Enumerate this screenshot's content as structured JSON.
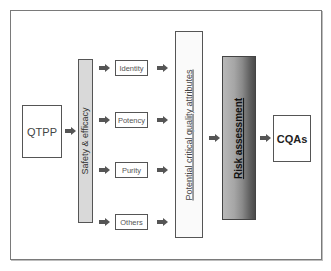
{
  "diagram": {
    "nodes": {
      "qtpp": "QTPP",
      "safety_efficacy": "Safety & efficacy",
      "attributes": [
        "Identity",
        "Potency",
        "Purity",
        "Others"
      ],
      "potential_cqa": "Potential critical quality attributes",
      "risk_assessment": "Risk assessment",
      "cqas": "CQAs"
    },
    "edges": [
      [
        "QTPP",
        "Safety & efficacy"
      ],
      [
        "Safety & efficacy",
        "Identity"
      ],
      [
        "Safety & efficacy",
        "Potency"
      ],
      [
        "Safety & efficacy",
        "Purity"
      ],
      [
        "Safety & efficacy",
        "Others"
      ],
      [
        "Identity",
        "Potential critical quality attributes"
      ],
      [
        "Potency",
        "Potential critical quality attributes"
      ],
      [
        "Purity",
        "Potential critical quality attributes"
      ],
      [
        "Others",
        "Potential critical quality attributes"
      ],
      [
        "Potential critical quality attributes",
        "Risk assessment"
      ],
      [
        "Risk assessment",
        "CQAs"
      ]
    ],
    "colors": {
      "arrow": "#555555",
      "border": "#555555",
      "safety_fill": "#d9d9d9",
      "risk_gradient_light": "#b8b8b8",
      "risk_gradient_dark": "#4a4a4a"
    }
  }
}
